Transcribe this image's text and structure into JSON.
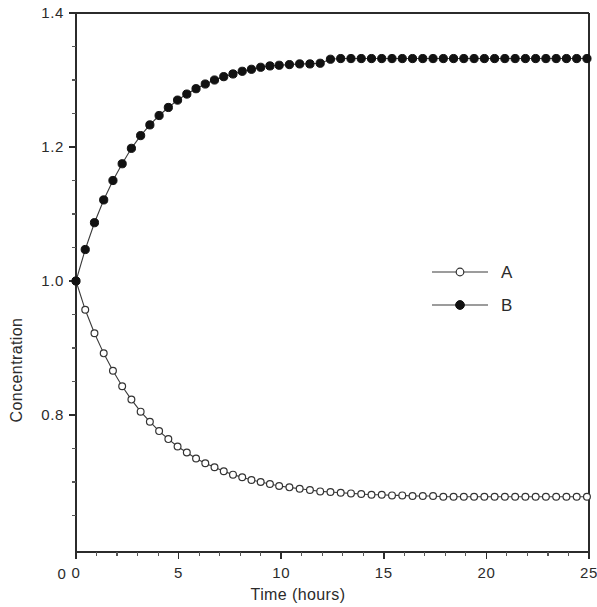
{
  "chart_data": {
    "type": "line",
    "title": "",
    "xlabel": "Time (hours)",
    "ylabel": "Concentration",
    "xlim": [
      0,
      25
    ],
    "ylim": [
      0.6,
      1.4
    ],
    "y_axis_break": true,
    "y_zero_label": "0",
    "grid": false,
    "legend_position": "center-right",
    "xticks": [
      0,
      5,
      10,
      15,
      20,
      25
    ],
    "xticklabels": [
      "0",
      "5",
      "10",
      "15",
      "20",
      "25"
    ],
    "xticks_minor": [
      1,
      2,
      3,
      4,
      6,
      7,
      8,
      9,
      11,
      12,
      13,
      14,
      16,
      17,
      18,
      19,
      21,
      22,
      23,
      24
    ],
    "yticks": [
      0.8,
      1.0,
      1.2,
      1.4
    ],
    "yticklabels": [
      "0.8",
      "1.0",
      "1.2",
      "1.4"
    ],
    "yticks_minor": [
      0.65,
      0.7,
      0.75,
      0.85,
      0.9,
      0.95,
      1.05,
      1.1,
      1.15,
      1.25,
      1.3,
      1.35
    ],
    "series": [
      {
        "name": "A",
        "marker": "open-circle",
        "x": [
          0,
          0.45,
          0.9,
          1.35,
          1.8,
          2.25,
          2.7,
          3.15,
          3.6,
          4.05,
          4.5,
          4.95,
          5.4,
          5.85,
          6.3,
          6.75,
          7.2,
          7.65,
          8.1,
          8.55,
          9.0,
          9.45,
          9.9,
          10.4,
          10.9,
          11.4,
          11.9,
          12.4,
          12.9,
          13.4,
          13.9,
          14.4,
          14.9,
          15.4,
          15.9,
          16.4,
          16.9,
          17.4,
          17.9,
          18.4,
          18.9,
          19.4,
          19.9,
          20.4,
          20.9,
          21.4,
          21.9,
          22.4,
          22.9,
          23.4,
          23.9,
          24.4,
          24.9
        ],
        "y": [
          1.0,
          0.957,
          0.922,
          0.892,
          0.866,
          0.843,
          0.823,
          0.805,
          0.79,
          0.776,
          0.764,
          0.753,
          0.744,
          0.735,
          0.728,
          0.722,
          0.716,
          0.711,
          0.707,
          0.703,
          0.7,
          0.697,
          0.694,
          0.692,
          0.69,
          0.688,
          0.686,
          0.685,
          0.684,
          0.683,
          0.682,
          0.681,
          0.681,
          0.68,
          0.68,
          0.679,
          0.679,
          0.679,
          0.678,
          0.678,
          0.678,
          0.678,
          0.678,
          0.678,
          0.678,
          0.678,
          0.678,
          0.678,
          0.678,
          0.678,
          0.678,
          0.678,
          0.678
        ]
      },
      {
        "name": "B",
        "marker": "filled-circle",
        "x": [
          0,
          0.45,
          0.9,
          1.35,
          1.8,
          2.25,
          2.7,
          3.15,
          3.6,
          4.05,
          4.5,
          4.95,
          5.4,
          5.85,
          6.3,
          6.75,
          7.2,
          7.65,
          8.1,
          8.55,
          9.0,
          9.45,
          9.9,
          10.4,
          10.9,
          11.4,
          11.9,
          12.4,
          12.9,
          13.4,
          13.9,
          14.4,
          14.9,
          15.4,
          15.9,
          16.4,
          16.9,
          17.4,
          17.9,
          18.4,
          18.9,
          19.4,
          19.9,
          20.4,
          20.9,
          21.4,
          21.9,
          22.4,
          22.9,
          23.4,
          23.9,
          24.4,
          24.9
        ],
        "y": [
          1.0,
          1.047,
          1.087,
          1.121,
          1.15,
          1.175,
          1.198,
          1.217,
          1.233,
          1.247,
          1.259,
          1.27,
          1.279,
          1.287,
          1.294,
          1.3,
          1.305,
          1.309,
          1.313,
          1.316,
          1.319,
          1.321,
          1.322,
          1.323,
          1.324,
          1.324,
          1.325,
          1.331,
          1.332,
          1.332,
          1.332,
          1.332,
          1.332,
          1.332,
          1.332,
          1.332,
          1.332,
          1.332,
          1.332,
          1.332,
          1.332,
          1.332,
          1.332,
          1.332,
          1.332,
          1.332,
          1.332,
          1.332,
          1.332,
          1.332,
          1.332,
          1.332,
          1.332
        ]
      }
    ],
    "legend": [
      {
        "label": "A",
        "marker": "open-circle"
      },
      {
        "label": "B",
        "marker": "filled-circle"
      }
    ],
    "colors": {
      "line": "#3a3a3a",
      "axis": "#2b2b2b",
      "marker_fill_b": "#111111",
      "marker_fill_a": "#ffffff",
      "background": "#ffffff"
    }
  }
}
